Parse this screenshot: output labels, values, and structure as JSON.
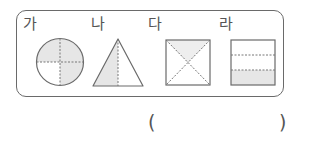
{
  "problem": {
    "figures": [
      {
        "label": "가",
        "shape": "circle",
        "parts": 4,
        "shaded_parts": 2,
        "shaded_description": "top-right and bottom-right quarters... upper half area shaded"
      },
      {
        "label": "나",
        "shape": "triangle",
        "parts": 2,
        "shaded_parts": 1
      },
      {
        "label": "다",
        "shape": "square",
        "parts": 4,
        "shaded_parts": 1
      },
      {
        "label": "라",
        "shape": "rectangle",
        "parts": 3,
        "shaded_parts": 1
      }
    ],
    "answer_blank": {
      "open": "(",
      "close": ")",
      "value": ""
    }
  },
  "colors": {
    "outline": "#6a6a6a",
    "shade": "#e6e6e6",
    "dash": "#777777"
  }
}
